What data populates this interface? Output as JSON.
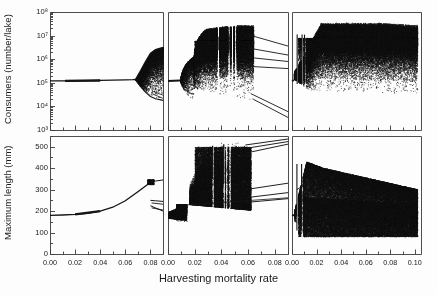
{
  "figure": {
    "type": "bifurcation-diagram-grid",
    "xlabel": "Harvesting mortality rate",
    "rows": 2,
    "cols": 3
  },
  "axes": {
    "top": {
      "ylabel": "Consumers (number/lake)",
      "scale": "log10",
      "ylim": [
        1000,
        100000000
      ],
      "ticks": [
        "10³",
        "10⁴",
        "10⁵",
        "10⁶",
        "10⁷",
        "10⁸"
      ],
      "tick_values": [
        1000,
        10000,
        100000,
        1000000,
        10000000,
        100000000
      ]
    },
    "bottom": {
      "ylabel": "Maximum length (mm)",
      "scale": "linear",
      "ylim": [
        0,
        550
      ],
      "ticks": [
        "0",
        "100",
        "200",
        "300",
        "400",
        "500"
      ],
      "tick_values": [
        0,
        100,
        200,
        300,
        400,
        500
      ]
    },
    "x": {
      "panel1_ticks": [
        "0.00",
        "0.02",
        "0.04",
        "0.06",
        "0.08"
      ],
      "panel2_ticks": [
        "0.00",
        "0.02",
        "0.04",
        "0.06",
        "0.08"
      ],
      "panel3_ticks": [
        "0.00",
        "0.02",
        "0.04",
        "0.06",
        "0.08",
        "0.10"
      ],
      "panel1_lim": [
        0.0,
        0.09
      ],
      "panel2_lim": [
        0.0,
        0.09
      ],
      "panel3_lim": [
        0.0,
        0.105
      ]
    }
  },
  "colors": {
    "ink": "#151515",
    "axis": "#3a3a3a",
    "background": "#fdfdfd"
  },
  "chart_data": [
    {
      "type": "scatter",
      "panel": "top-left",
      "title": "",
      "xlabel": "Harvesting mortality rate",
      "ylabel": "Consumers (number/lake)",
      "yscale": "log10",
      "ylim": [
        1000,
        100000000
      ],
      "xlim": [
        0.0,
        0.09
      ],
      "grid": false,
      "legend": null,
      "description": "Stable equilibrium near 1.2e5 consumers from x=0 to x=0.068, then Hopf bifurcation producing rapidly widening cycle amplitude; upper branch rises toward 3e6 and lower branch falls toward 2e4 by x=0.09",
      "branches": [
        {
          "name": "equilibrium",
          "x": [
            0.0,
            0.01,
            0.02,
            0.03,
            0.04,
            0.05,
            0.06,
            0.066,
            0.068
          ],
          "y": [
            120000,
            121000,
            122000,
            124000,
            126000,
            129000,
            133000,
            136000,
            138000
          ]
        },
        {
          "name": "cycle-max",
          "x": [
            0.068,
            0.072,
            0.076,
            0.08,
            0.084,
            0.09
          ],
          "y": [
            138000,
            320000,
            800000,
            1800000,
            2600000,
            3200000
          ]
        },
        {
          "name": "cycle-min",
          "x": [
            0.068,
            0.072,
            0.076,
            0.08,
            0.084,
            0.09
          ],
          "y": [
            138000,
            70000,
            40000,
            26000,
            21000,
            18000
          ]
        }
      ]
    },
    {
      "type": "scatter",
      "panel": "top-middle",
      "yscale": "log10",
      "ylim": [
        1000,
        100000000
      ],
      "xlim": [
        0.0,
        0.09
      ],
      "grid": false,
      "description": "Small-amplitude cycle from x=0 to 0.010, then period-doubling cascade into a broad chaotic band spanning 1e4 to 3e7 between x=0.018 and 0.062; band collapses abruptly after x=0.064 leaving descending branches",
      "regions": [
        {
          "name": "low-amplitude-cycle",
          "x_range": [
            0.0,
            0.01
          ],
          "y_range": [
            90000,
            170000
          ]
        },
        {
          "name": "period-doubling",
          "x_range": [
            0.01,
            0.018
          ],
          "y_range": [
            30000,
            900000
          ]
        },
        {
          "name": "chaotic-band",
          "x_range": [
            0.018,
            0.062
          ],
          "y_range": [
            12000,
            30000000
          ]
        },
        {
          "name": "periodic-windows",
          "x_values": [
            0.038,
            0.046,
            0.048
          ],
          "note": "narrow white vertical gaps in chaotic band"
        },
        {
          "name": "collapse-branches",
          "x_range": [
            0.062,
            0.09
          ],
          "y_range": [
            3000,
            4000000
          ]
        }
      ]
    },
    {
      "type": "scatter",
      "panel": "top-right",
      "yscale": "log10",
      "ylim": [
        1000,
        100000000
      ],
      "xlim": [
        0.0,
        0.105
      ],
      "grid": false,
      "description": "Immediate wide chaotic attractor from x=0.002; dense band rises to upper envelope near 4e7 by x=0.03 and persists flat to x=0.10; lower envelope drops from 3e5 to 3e4",
      "regions": [
        {
          "name": "onset",
          "x_range": [
            0.0,
            0.008
          ],
          "y_range": [
            60000,
            4000000
          ]
        },
        {
          "name": "chaotic-band",
          "x_range": [
            0.008,
            0.1
          ],
          "y_range": [
            30000,
            40000000
          ]
        },
        {
          "name": "periodic-windows",
          "x_values": [
            0.004,
            0.008,
            0.01
          ],
          "note": "narrow white vertical gaps near left edge"
        }
      ]
    },
    {
      "type": "scatter",
      "panel": "bottom-left",
      "ylabel": "Maximum length (mm)",
      "yscale": "linear",
      "ylim": [
        0,
        550
      ],
      "xlim": [
        0.0,
        0.09
      ],
      "grid": false,
      "description": "Maximum consumer length increases smoothly from 180 mm at x=0 to about 335 mm at x=0.080, then splits into several branches between 195 and 345 mm",
      "branches": [
        {
          "name": "equilibrium-length",
          "x": [
            0.0,
            0.01,
            0.02,
            0.03,
            0.04,
            0.05,
            0.06,
            0.07,
            0.078,
            0.08
          ],
          "y": [
            180,
            182,
            185,
            190,
            200,
            218,
            248,
            290,
            325,
            335
          ]
        },
        {
          "name": "branch-upper",
          "x": [
            0.08,
            0.084,
            0.09
          ],
          "y": [
            335,
            340,
            345
          ]
        },
        {
          "name": "branch-mid",
          "x": [
            0.08,
            0.084,
            0.09
          ],
          "y": [
            250,
            248,
            245
          ]
        },
        {
          "name": "branch-low",
          "x": [
            0.08,
            0.084,
            0.09
          ],
          "y": [
            225,
            215,
            200
          ]
        }
      ]
    },
    {
      "type": "scatter",
      "panel": "bottom-middle",
      "yscale": "linear",
      "ylim": [
        0,
        550
      ],
      "xlim": [
        0.0,
        0.09
      ],
      "grid": false,
      "description": "Compact cluster near 170-230 mm up to x=0.012, then broad scatter expanding to 300-520 mm across x=0.018-0.062 with strong periodic windows; several near-linear branches exit to the right between 230 and 530 mm",
      "regions": [
        {
          "name": "low-cluster",
          "x_range": [
            0.0,
            0.014
          ],
          "y_range": [
            150,
            235
          ]
        },
        {
          "name": "chaotic-scatter",
          "x_range": [
            0.018,
            0.062
          ],
          "y_range": [
            195,
            520
          ]
        },
        {
          "name": "periodic-windows",
          "x_values": [
            0.034,
            0.042,
            0.044
          ],
          "note": "white vertical gaps"
        },
        {
          "name": "exit-branches",
          "x_range": [
            0.062,
            0.09
          ],
          "y_range": [
            240,
            535
          ]
        }
      ]
    },
    {
      "type": "scatter",
      "panel": "bottom-right",
      "yscale": "linear",
      "ylim": [
        0,
        550
      ],
      "xlim": [
        0.0,
        0.105
      ],
      "grid": false,
      "description": "Dense scatter from x=0.002; upper envelope peaks near 430 mm around x=0.008-0.020 then decays to about 300 mm; solid dark mass fills 80-300 mm across the full range",
      "regions": [
        {
          "name": "peak-envelope",
          "x_range": [
            0.004,
            0.022
          ],
          "y_range": [
            150,
            430
          ]
        },
        {
          "name": "decaying-envelope",
          "x_range": [
            0.022,
            0.1
          ],
          "y_range": [
            90,
            310
          ]
        },
        {
          "name": "dense-core",
          "x_range": [
            0.006,
            0.1
          ],
          "y_range": [
            80,
            265
          ]
        },
        {
          "name": "periodic-windows",
          "x_values": [
            0.004,
            0.008
          ],
          "note": "white vertical gaps near left edge"
        }
      ]
    }
  ]
}
